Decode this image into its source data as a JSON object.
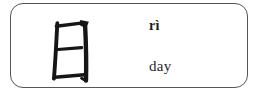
{
  "card": {
    "character": "日",
    "pinyin": "rì",
    "meaning": "day"
  },
  "icons": {
    "hanzi_glyph": "hanzi-ri-brush-glyph"
  },
  "colors": {
    "page_background": "#ffffff",
    "card_background": "#ffffff",
    "card_border": "#555555",
    "ink": "#161616",
    "pinyin_text": "#1c1c1c",
    "meaning_text": "#2a2a2a"
  }
}
